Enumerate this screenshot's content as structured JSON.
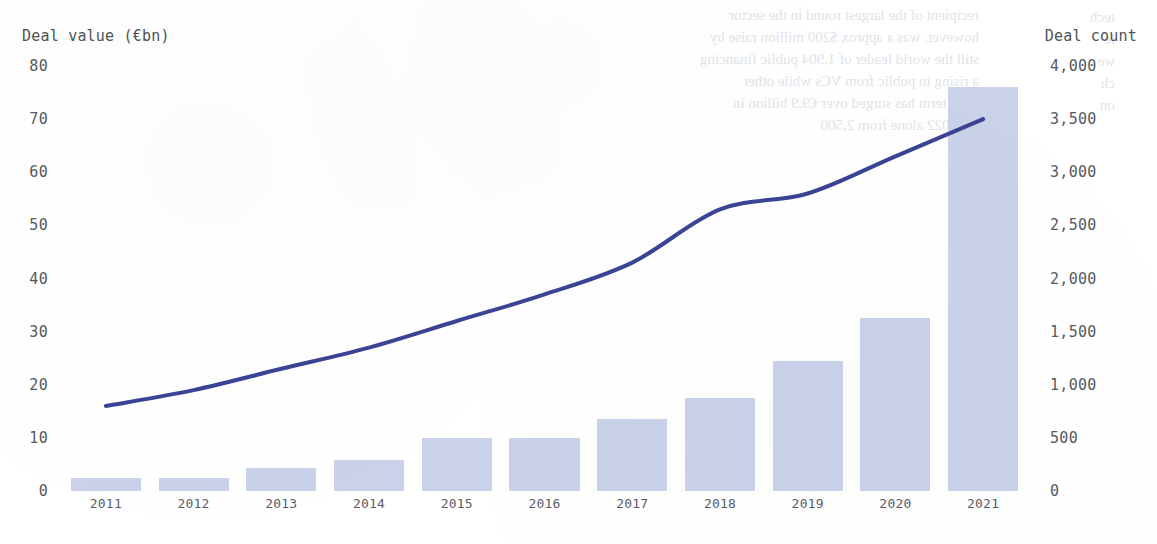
{
  "chart_data": {
    "type": "bar",
    "title": "",
    "subtitle": "",
    "categories": [
      "2011",
      "2012",
      "2013",
      "2014",
      "2015",
      "2016",
      "2017",
      "2018",
      "2019",
      "2020",
      "2021"
    ],
    "xlabel": "",
    "grid": false,
    "legend_position": "none",
    "series": [
      {
        "name": "Deal value (€bn)",
        "type": "bar",
        "axis": "left",
        "color": "#c9d2e9",
        "values": [
          2.5,
          2.5,
          4.3,
          5.8,
          10,
          10,
          13.5,
          17.5,
          24.5,
          32.5,
          76
        ]
      },
      {
        "name": "Deal count",
        "type": "line",
        "axis": "right",
        "color": "#3b4395",
        "values": [
          800,
          950,
          1150,
          1350,
          1600,
          1850,
          2150,
          2650,
          2800,
          3150,
          3500
        ]
      }
    ],
    "left_axis": {
      "label": "Deal value (€bn)",
      "ticks": [
        "0",
        "10",
        "20",
        "30",
        "40",
        "50",
        "60",
        "70",
        "80"
      ],
      "tick_values": [
        0,
        10,
        20,
        30,
        40,
        50,
        60,
        70,
        80
      ],
      "ylim": [
        0,
        80
      ]
    },
    "right_axis": {
      "label": "Deal count",
      "ticks": [
        "0",
        "500",
        "1,000",
        "1,500",
        "2,000",
        "2,500",
        "3,000",
        "3,500",
        "4,000"
      ],
      "tick_values": [
        0,
        500,
        1000,
        1500,
        2000,
        2500,
        3000,
        3500,
        4000
      ],
      "ylim": [
        0,
        4000
      ]
    }
  },
  "background_text": {
    "block_a": [
      "recipient of the largest round in the sector",
      "however, was a approx $200 million raise by",
      "still the world leader of 1,904 public financing",
      "a rising in public from VCs while other",
      "Seed term has surged over €9.9 billion in",
      "Q1 2022 alone from 2,500"
    ],
    "block_b": [
      "tech",
      "le",
      "we",
      "ch",
      "on"
    ]
  },
  "colors": {
    "bar": "#c9d2e9",
    "line": "#3b4395",
    "tick_text": "#555a60",
    "axis_title": "#4d5358",
    "background": "#ffffff"
  }
}
